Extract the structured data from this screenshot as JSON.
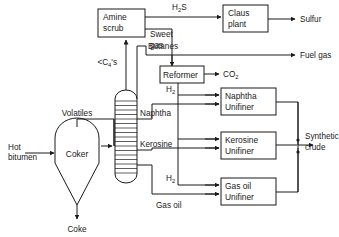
{
  "diagram": {
    "type": "process-flow-diagram",
    "line_color": "#1a1a1a",
    "background_color": "#ffffff",
    "units": [
      {
        "id": "coker",
        "label_line1": "Coker",
        "label_line2": "",
        "shape": "vessel-conical-bottom"
      },
      {
        "id": "fractionator",
        "label_line1": "",
        "label_line2": "",
        "shape": "trayed-column"
      },
      {
        "id": "amine-scrub",
        "label_line1": "Amine",
        "label_line2": "scrub",
        "shape": "rect"
      },
      {
        "id": "claus-plant",
        "label_line1": "Claus",
        "label_line2": "plant",
        "shape": "rect"
      },
      {
        "id": "reformer",
        "label_line1": "Reformer",
        "label_line2": "",
        "shape": "rect"
      },
      {
        "id": "naphtha-unifiner",
        "label_line1": "Naphtha",
        "label_line2": "Unifiner",
        "shape": "rect"
      },
      {
        "id": "kerosine-unifiner",
        "label_line1": "Kerosine",
        "label_line2": "Unifiner",
        "shape": "rect"
      },
      {
        "id": "gas-oil-unifiner",
        "label_line1": "Gas oil",
        "label_line2": "Unifiner",
        "shape": "rect"
      }
    ],
    "streams": [
      {
        "id": "hot-bitumen",
        "label_line1": "Hot",
        "label_line2": "bitumen"
      },
      {
        "id": "coke",
        "label_line1": "Coke",
        "label_line2": ""
      },
      {
        "id": "volatiles",
        "label_line1": "Volatiles",
        "label_line2": ""
      },
      {
        "id": "light-ends",
        "label_line1": "<C",
        "label_sub": "4",
        "label_suffix": "'s"
      },
      {
        "id": "h2s",
        "label_line1": "H",
        "label_sub": "2",
        "label_suffix": "S"
      },
      {
        "id": "sulfur",
        "label_line1": "Sulfur",
        "label_line2": ""
      },
      {
        "id": "sweet-gas",
        "label_line1": "Sweet",
        "label_line2": "gas"
      },
      {
        "id": "fuel-gas",
        "label_line1": "Fuel gas",
        "label_line2": ""
      },
      {
        "id": "butanes",
        "label_line1": "Butanes",
        "label_line2": ""
      },
      {
        "id": "co2",
        "label_line1": "CO",
        "label_sub": "2",
        "label_suffix": ""
      },
      {
        "id": "hydrogen-1",
        "label_line1": "H",
        "label_sub": "2",
        "label_suffix": ""
      },
      {
        "id": "hydrogen-2",
        "label_line1": "H",
        "label_sub": "2",
        "label_suffix": ""
      },
      {
        "id": "naphtha",
        "label_line1": "Naphtha",
        "label_line2": ""
      },
      {
        "id": "kerosine",
        "label_line1": "Kerosine",
        "label_line2": ""
      },
      {
        "id": "gas-oil",
        "label_line1": "Gas oil",
        "label_line2": ""
      },
      {
        "id": "synthetic-crude",
        "label_line1": "Synthetic",
        "label_line2": "crude"
      }
    ],
    "labels": {
      "hot_bitumen_l1": "Hot",
      "hot_bitumen_l2": "bitumen",
      "coker": "Coker",
      "coke": "Coke",
      "volatiles": "Volatiles",
      "light_ends_pre": "<C",
      "light_ends_sub": "4",
      "light_ends_post": "'s",
      "amine_l1": "Amine",
      "amine_l2": "scrub",
      "h2s_pre": "H",
      "h2s_sub": "2",
      "h2s_post": "S",
      "claus_l1": "Claus",
      "claus_l2": "plant",
      "sulfur": "Sulfur",
      "sweet_gas_l1": "Sweet",
      "sweet_gas_l2": "gas",
      "fuel_gas": "Fuel gas",
      "butanes": "Butanes",
      "reformer": "Reformer",
      "co2_pre": "CO",
      "co2_sub": "2",
      "h2_a_pre": "H",
      "h2_a_sub": "2",
      "h2_b_pre": "H",
      "h2_b_sub": "2",
      "naphtha": "Naphtha",
      "naphtha_unifiner_l1": "Naphtha",
      "naphtha_unifiner_l2": "Unifiner",
      "kerosine": "Kerosine",
      "kerosine_unifiner_l1": "Kerosine",
      "kerosine_unifiner_l2": "Unifiner",
      "gas_oil": "Gas oil",
      "gas_oil_unifiner_l1": "Gas oil",
      "gas_oil_unifiner_l2": "Unifiner",
      "synthetic_crude_l1": "Synthetic",
      "synthetic_crude_l2": "crude"
    }
  }
}
